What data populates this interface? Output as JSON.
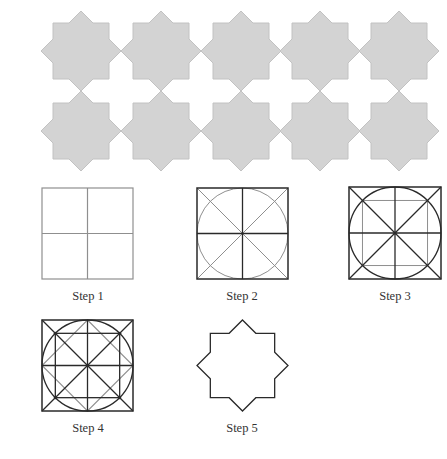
{
  "colors": {
    "star_fill": "#d3d3d3",
    "star_stroke": "#c2c2c2",
    "line_black": "#2a2a2a",
    "line_gray": "#8f8f8f",
    "label": "#333333"
  },
  "tiles": {
    "rows": 2,
    "cols": 5,
    "centers_x": [
      81,
      161,
      241,
      320,
      399
    ],
    "centers_y": [
      51,
      131
    ],
    "outer_radius": 40,
    "square_half": 28
  },
  "steps": [
    {
      "id": 1,
      "label": "Step 1",
      "x": 42,
      "y": 188,
      "size": 91,
      "label_cx": 88,
      "label_y": 289,
      "description": "Square divided into four quadrants by vertical and horizontal center lines (gray)"
    },
    {
      "id": 2,
      "label": "Step 2",
      "x": 197,
      "y": 188,
      "size": 91,
      "label_cx": 242,
      "label_y": 289,
      "description": "Square with center lines (black), diagonals and inscribed circle (gray)"
    },
    {
      "id": 3,
      "label": "Step 3",
      "x": 349,
      "y": 187,
      "size": 92,
      "label_cx": 395,
      "label_y": 289,
      "description": "Square with center lines, diagonals and circle (black); inner square through circle/diagonal intersections (gray)"
    },
    {
      "id": 4,
      "label": "Step 4",
      "x": 42,
      "y": 320,
      "size": 91,
      "label_cx": 88,
      "label_y": 421,
      "description": "Inner square (black) plus rotated square through circle/axis intersections (gray)"
    },
    {
      "id": 5,
      "label": "Step 5",
      "x": 197,
      "y": 320,
      "size": 91,
      "label_cx": 242,
      "label_y": 421,
      "description": "Resulting eight-pointed star outline"
    }
  ]
}
